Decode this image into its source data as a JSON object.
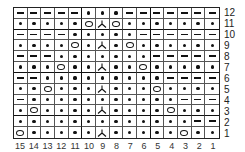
{
  "chart": {
    "columns": 15,
    "rows": 12,
    "legend_symbols": {
      "-": "purl",
      ".": "knit",
      "O": "yarn-over",
      "A": "centered-double-decrease"
    },
    "grid_rows_top_to_bottom": [
      {
        "row": 12,
        "cells": [
          "-",
          "-",
          "-",
          "-",
          "-",
          ".",
          ".",
          ".",
          "-",
          "-",
          "-",
          "-",
          "-",
          "-",
          "-"
        ]
      },
      {
        "row": 11,
        "cells": [
          ".",
          ".",
          ".",
          ".",
          ".",
          "O",
          "A",
          "O",
          ".",
          ".",
          ".",
          ".",
          ".",
          ".",
          "."
        ]
      },
      {
        "row": 10,
        "cells": [
          "-",
          "-",
          "-",
          "-",
          ".",
          ".",
          ".",
          ".",
          ".",
          "-",
          "-",
          "-",
          "-",
          "-",
          "-"
        ]
      },
      {
        "row": 9,
        "cells": [
          ".",
          ".",
          ".",
          ".",
          "O",
          ".",
          "A",
          ".",
          "O",
          ".",
          ".",
          ".",
          ".",
          ".",
          "."
        ]
      },
      {
        "row": 8,
        "cells": [
          "-",
          "-",
          "-",
          ".",
          ".",
          ".",
          ".",
          ".",
          ".",
          ".",
          "-",
          "-",
          "-",
          "-",
          "-"
        ]
      },
      {
        "row": 7,
        "cells": [
          ".",
          ".",
          ".",
          "O",
          ".",
          ".",
          "A",
          ".",
          ".",
          "O",
          ".",
          ".",
          ".",
          ".",
          "."
        ]
      },
      {
        "row": 6,
        "cells": [
          "-",
          "-",
          ".",
          ".",
          ".",
          ".",
          ".",
          ".",
          ".",
          ".",
          ".",
          "-",
          "-",
          "-",
          "-"
        ]
      },
      {
        "row": 5,
        "cells": [
          ".",
          ".",
          "O",
          ".",
          ".",
          ".",
          "A",
          ".",
          ".",
          ".",
          "O",
          ".",
          ".",
          ".",
          "."
        ]
      },
      {
        "row": 4,
        "cells": [
          "-",
          ".",
          ".",
          ".",
          ".",
          ".",
          ".",
          ".",
          ".",
          ".",
          ".",
          ".",
          "-",
          "-",
          "-"
        ]
      },
      {
        "row": 3,
        "cells": [
          ".",
          "O",
          ".",
          ".",
          ".",
          ".",
          "A",
          ".",
          ".",
          ".",
          ".",
          "O",
          ".",
          ".",
          "."
        ]
      },
      {
        "row": 2,
        "cells": [
          ".",
          ".",
          ".",
          ".",
          ".",
          ".",
          ".",
          ".",
          ".",
          ".",
          ".",
          ".",
          ".",
          "-",
          "-"
        ]
      },
      {
        "row": 1,
        "cells": [
          "O",
          ".",
          ".",
          ".",
          ".",
          ".",
          "A",
          ".",
          ".",
          ".",
          ".",
          ".",
          "O",
          ".",
          "."
        ]
      }
    ],
    "row_labels": [
      "12",
      "11",
      "10",
      "9",
      "8",
      "7",
      "6",
      "5",
      "4",
      "3",
      "2",
      "1"
    ],
    "column_labels": [
      "15",
      "14",
      "13",
      "12",
      "11",
      "10",
      "9",
      "8",
      "7",
      "6",
      "5",
      "4",
      "3",
      "2",
      "1"
    ],
    "thick_vertical_after_column_index": [
      4,
      9
    ],
    "thick_horizontal_after_row_index": [
      1,
      5,
      9
    ]
  }
}
